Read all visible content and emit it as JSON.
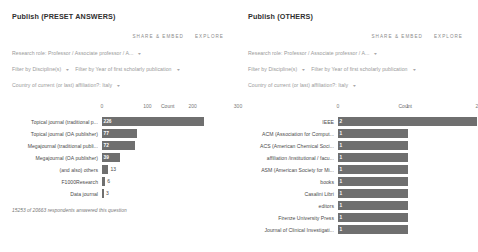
{
  "panels": [
    {
      "title": "Publish (PRESET ANSWERS)",
      "actions": {
        "share": "SHARE & EMBED",
        "explore": "EXPLORE"
      },
      "filters": [
        [
          {
            "text": "Research role: Professor / Associate professor / A...",
            "caret": "▾"
          }
        ],
        [
          {
            "text": "Filter by Discipline(s)",
            "caret": "▾"
          },
          {
            "text": "Filter by Year of first scholarly publication",
            "caret": "▾"
          }
        ],
        [
          {
            "text": "Country of current (or last) affiliation?: Italy",
            "caret": "▾"
          }
        ]
      ],
      "footnote": "15253 of 20663 respondents answered this question",
      "chart_data": {
        "type": "bar",
        "orientation": "horizontal",
        "title": "Count",
        "xlabel": "Count",
        "ylabel": "",
        "xlim": [
          0,
          300
        ],
        "ticks": [
          0,
          100,
          200,
          300
        ],
        "tick_labels": [
          "0",
          "100",
          "200",
          "300"
        ],
        "grid": false,
        "categories": [
          "Topical journal (traditional p...",
          "Topical journal (OA publisher)",
          "Megajournal (traditional publi...",
          "Megajournal (OA publisher)",
          "(and also) others",
          "F1000Research",
          "Data journal"
        ],
        "values": [
          226,
          77,
          72,
          39,
          13,
          6,
          3
        ],
        "value_labels": [
          "226",
          "77",
          "72",
          "39",
          "13",
          "6",
          "3"
        ]
      }
    },
    {
      "title": "Publish (OTHERS)",
      "actions": {
        "share": "SHARE & EMBED",
        "explore": "EXPLORE"
      },
      "filters": [
        [
          {
            "text": "Research role: Professor / Associate professor / A...",
            "caret": "▾"
          }
        ],
        [
          {
            "text": "Filter by Discipline(s)",
            "caret": "▾"
          },
          {
            "text": "Filter by Year of first scholarly publication",
            "caret": "▾"
          }
        ],
        [
          {
            "text": "Country of current (or last) affiliation?: Italy",
            "caret": "▾"
          }
        ]
      ],
      "footnote": "",
      "chart_data": {
        "type": "bar",
        "orientation": "horizontal",
        "title": "Count",
        "xlabel": "Count",
        "ylabel": "",
        "xlim": [
          0,
          2
        ],
        "ticks": [
          0,
          1,
          2
        ],
        "tick_labels": [
          "0",
          "1",
          "2"
        ],
        "grid": false,
        "categories": [
          "IEEE",
          "ACM (Association for Comput...",
          "ACS (American Chemical Soci...",
          "affiliation /institutional / facu...",
          "ASM (American Society for Mi...",
          "books",
          "Casalini Libri",
          "editors",
          "Firenze University Press",
          "Journal of Clinical Investigati..."
        ],
        "values": [
          2,
          1,
          1,
          1,
          1,
          1,
          1,
          1,
          1,
          1
        ],
        "value_labels": [
          "2",
          "1",
          "1",
          "1",
          "1",
          "1",
          "1",
          "1",
          "1",
          "1"
        ]
      }
    }
  ],
  "colors": {
    "bar": "#6f6f6f",
    "text": "#4a4a4a",
    "muted": "#9a9a9a"
  }
}
